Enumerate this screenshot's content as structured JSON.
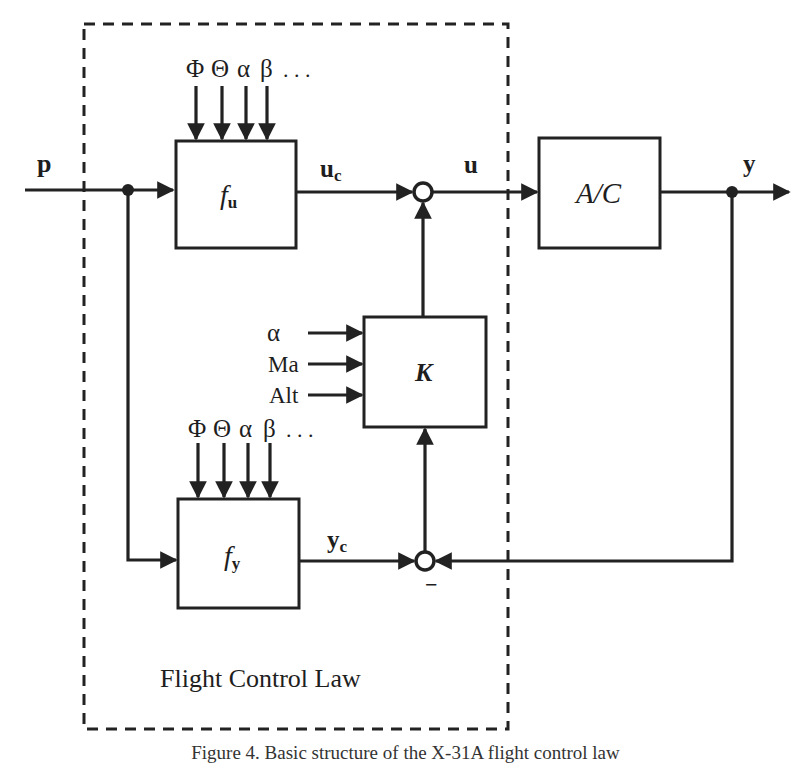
{
  "diagram": {
    "type": "block-diagram",
    "region_label": "Flight Control Law",
    "signals": {
      "input": "p",
      "fu_output": "u",
      "fu_output_sub": "c",
      "control": "u",
      "output": "y",
      "fy_output": "y",
      "fy_output_sub": "c",
      "feedback_sign": "−"
    },
    "blocks": {
      "fu": {
        "main": "f",
        "sub": "u"
      },
      "ac": {
        "label": "A/C"
      },
      "k": {
        "label": "K"
      },
      "fy": {
        "main": "f",
        "sub": "y"
      }
    },
    "fu_inputs": [
      "Φ",
      "Θ",
      "α",
      "β",
      ". . ."
    ],
    "fy_inputs": [
      "Φ",
      "Θ",
      "α",
      "β",
      ". . ."
    ],
    "k_inputs": [
      "α",
      "Ma",
      "Alt"
    ],
    "caption": "Figure 4.  Basic structure of the X-31A flight control law"
  }
}
